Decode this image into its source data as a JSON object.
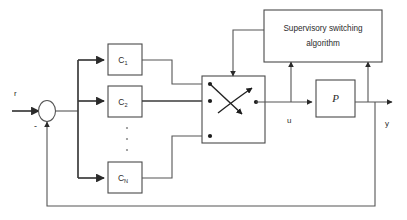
{
  "diagram": {
    "blocks": {
      "supervisor": {
        "line1": "Supervisory switching",
        "line2": "algorithm",
        "name": "supervisory-switching-algorithm-block"
      },
      "plant": {
        "label": "P",
        "name": "plant-block"
      },
      "controllers": [
        {
          "base": "C",
          "sub": "1",
          "name": "controller-c1-block"
        },
        {
          "base": "C",
          "sub": "2",
          "name": "controller-c2-block"
        },
        {
          "base": "C",
          "sub": "N",
          "name": "controller-cn-block"
        }
      ],
      "switch": {
        "name": "switch-block",
        "input_terminals": 3,
        "output_terminals": 2
      },
      "summing_junction": {
        "name": "summing-junction",
        "sign": "-"
      }
    },
    "signals": {
      "reference": "r",
      "control": "u",
      "output": "y",
      "feedback_sign": "-"
    },
    "ellipsis": "vertical-dots",
    "colors": {
      "background": "#ffffff",
      "line": "#555555",
      "block_stroke": "#4a4a4a",
      "text": "#2b2b2b",
      "terminal": "#1c1c1c"
    }
  }
}
